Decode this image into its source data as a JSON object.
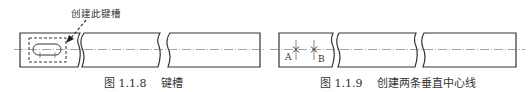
{
  "figures": [
    {
      "number": "图 1.1.8",
      "title": "键槽",
      "callout": "创建此键槽"
    },
    {
      "number": "图 1.1.9",
      "title": "创建两条垂直中心线",
      "points": [
        "A",
        "B"
      ]
    }
  ]
}
